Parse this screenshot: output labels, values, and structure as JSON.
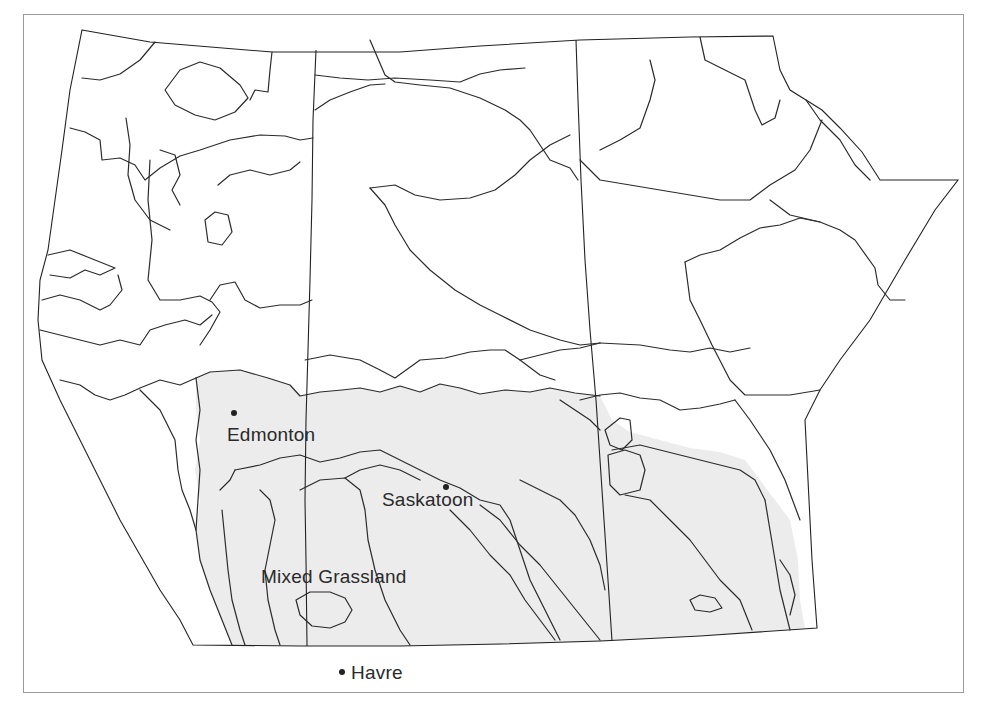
{
  "map": {
    "title": "",
    "region": "Canadian Prairie Provinces (Alberta, Saskatchewan, Manitoba)",
    "colors": {
      "background": "#ffffff",
      "frame": "#9a9a9a",
      "boundary_lines": "#2b2b2b",
      "grassland_fill": "#ececec",
      "text": "#2a2a2a"
    },
    "labels": {
      "edmonton": "Edmonton",
      "saskatoon": "Saskatoon",
      "mixed_grassland": "Mixed Grassland",
      "havre": "Havre"
    },
    "cities": [
      {
        "name": "Edmonton",
        "marker": "dot"
      },
      {
        "name": "Saskatoon",
        "marker": "dot"
      },
      {
        "name": "Havre",
        "marker": "dot"
      }
    ],
    "regions": [
      {
        "name": "Mixed Grassland",
        "shaded": true
      }
    ]
  }
}
